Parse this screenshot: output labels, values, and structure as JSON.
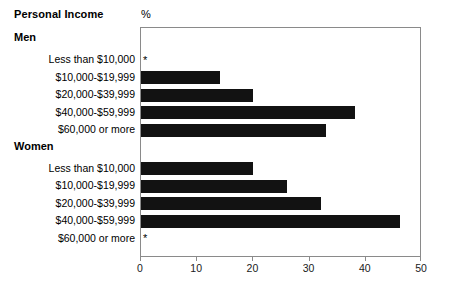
{
  "header": {
    "title": "Personal Income",
    "unit_label": "%"
  },
  "chart_data": {
    "type": "bar",
    "orientation": "horizontal",
    "title": "Personal Income",
    "xlabel": "%",
    "ylabel": "",
    "xlim": [
      0,
      50
    ],
    "xticks": [
      0,
      10,
      20,
      30,
      40,
      50
    ],
    "xtick_labels": [
      "0",
      "10",
      "20",
      "30",
      "40",
      "50"
    ],
    "grid": false,
    "legend": false,
    "bar_color": "#121212",
    "frame_color": "#8a8a8a",
    "suppressed_marker": "*",
    "categories": [
      "Less than $10,000",
      "$10,000-$19,999",
      "$20,000-$39,999",
      "$40,000-$59,999",
      "$60,000 or more"
    ],
    "groups": [
      {
        "name": "Men",
        "values": [
          null,
          14,
          20,
          38,
          33
        ],
        "bars": [
          {
            "label": "Less than $10,000",
            "value": null,
            "suppressed": true
          },
          {
            "label": "$10,000-$19,999",
            "value": 14,
            "suppressed": false
          },
          {
            "label": "$20,000-$39,999",
            "value": 20,
            "suppressed": false
          },
          {
            "label": "$40,000-$59,999",
            "value": 38,
            "suppressed": false
          },
          {
            "label": "$60,000 or more",
            "value": 33,
            "suppressed": false
          }
        ]
      },
      {
        "name": "Women",
        "values": [
          20,
          26,
          32,
          46,
          null
        ],
        "bars": [
          {
            "label": "Less than $10,000",
            "value": 20,
            "suppressed": false
          },
          {
            "label": "$10,000-$19,999",
            "value": 26,
            "suppressed": false
          },
          {
            "label": "$20,000-$39,999",
            "value": 32,
            "suppressed": false
          },
          {
            "label": "$40,000-$59,999",
            "value": 46,
            "suppressed": false
          },
          {
            "label": "$60,000 or more",
            "value": null,
            "suppressed": true
          }
        ]
      }
    ]
  }
}
